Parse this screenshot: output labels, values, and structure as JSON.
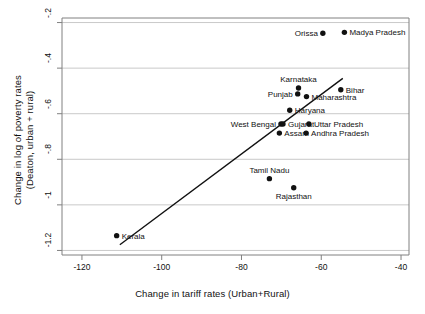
{
  "chart_data": {
    "type": "scatter",
    "title": "",
    "xlabel": "Change in tariff rates (Urban+Rural)",
    "ylabel_line1": "Change in log of poverty rates",
    "ylabel_line2": "(Deaton, urban + rural)",
    "xlim": [
      -125,
      -38
    ],
    "ylim": [
      -1.22,
      -0.18
    ],
    "xticks": [
      -120,
      -100,
      -80,
      -60,
      -40
    ],
    "xticklabels": [
      "-120",
      "-100",
      "-80",
      "-60",
      "-40"
    ],
    "yticks": [
      -0.2,
      -0.4,
      -0.6,
      -0.8,
      -1,
      -1.2
    ],
    "yticklabels": [
      "-.2",
      "-.4",
      "-.6",
      "-.8",
      "-1",
      "-1.2"
    ],
    "grid": "horizontal",
    "legend": "none",
    "marker_color": "#111111",
    "line_color": "#111111",
    "grid_color": "#c9c9c9",
    "frame_color": "#808080",
    "points": [
      {
        "label": "Orissa",
        "x": -59.6,
        "y": -0.247,
        "label_pos": "left"
      },
      {
        "label": "Madya Pradesh",
        "x": -54.2,
        "y": -0.243,
        "label_pos": "right"
      },
      {
        "label": "Karnataka",
        "x": -65.7,
        "y": -0.487,
        "label_pos": "above"
      },
      {
        "label": "Punjab",
        "x": -65.9,
        "y": -0.513,
        "label_pos": "left"
      },
      {
        "label": "Maharashtra",
        "x": -63.7,
        "y": -0.525,
        "label_pos": "right"
      },
      {
        "label": "Bihar",
        "x": -55.1,
        "y": -0.495,
        "label_pos": "right"
      },
      {
        "label": "Haryana",
        "x": -67.9,
        "y": -0.585,
        "label_pos": "right"
      },
      {
        "label": "West Bengal",
        "x": -70.1,
        "y": -0.645,
        "label_pos": "left"
      },
      {
        "label": "Gujarat",
        "x": -69.6,
        "y": -0.645,
        "label_pos": "right"
      },
      {
        "label": "Uttar Pradesh",
        "x": -63.1,
        "y": -0.645,
        "label_pos": "right"
      },
      {
        "label": "Assam",
        "x": -70.5,
        "y": -0.685,
        "label_pos": "right"
      },
      {
        "label": "Andhra Pradesh",
        "x": -63.8,
        "y": -0.685,
        "label_pos": "right"
      },
      {
        "label": "Tamil Nadu",
        "x": -73.0,
        "y": -0.885,
        "label_pos": "above"
      },
      {
        "label": "Rajasthan",
        "x": -66.9,
        "y": -0.925,
        "label_pos": "below"
      },
      {
        "label": "Kerala",
        "x": -111.3,
        "y": -1.135,
        "label_pos": "right"
      }
    ],
    "trend_line": {
      "x1": -110.5,
      "y1": -1.175,
      "x2": -54.6,
      "y2": -0.445
    }
  }
}
